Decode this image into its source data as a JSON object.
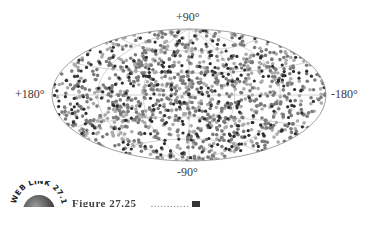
{
  "chart_data": {
    "type": "scatter",
    "projection": "aitoff-all-sky (galactic coordinates)",
    "title": "",
    "axis_labels": {
      "top": "+90°",
      "bottom": "-90°",
      "left": "+180°",
      "right": "-180°"
    },
    "xlabel": "Galactic longitude",
    "ylabel": "Galactic latitude",
    "xlim": [
      180,
      -180
    ],
    "ylim": [
      -90,
      90
    ],
    "grid": true,
    "grid_meridians_deg": [
      -120,
      -60,
      0,
      60,
      120
    ],
    "grid_parallels_deg": [
      -60,
      -30,
      0,
      30,
      60
    ],
    "distribution": "isotropic (uniform over the sky)",
    "series": [
      {
        "name": "dark points",
        "color": "#2e2e2e",
        "approx_count": 280
      },
      {
        "name": "medium points",
        "color": "#7a7a7a",
        "approx_count": 600
      },
      {
        "name": "light points",
        "color": "#ababab",
        "approx_count": 520
      }
    ],
    "approx_total_points": 1400,
    "legend": "none"
  },
  "colors": {
    "background": "#ffffff",
    "outline": "#8a8a8a",
    "grid": "#b5b5b5",
    "dark_dot": "#2e2e2e",
    "medium_dot": "#7a7a7a",
    "light_dot": "#ababab",
    "label_text": "#3a3a3a"
  },
  "weblink": {
    "text": "WEB LINK 27.16"
  },
  "caption": {
    "figure_number": "Figure 27.25",
    "rest": "............"
  }
}
